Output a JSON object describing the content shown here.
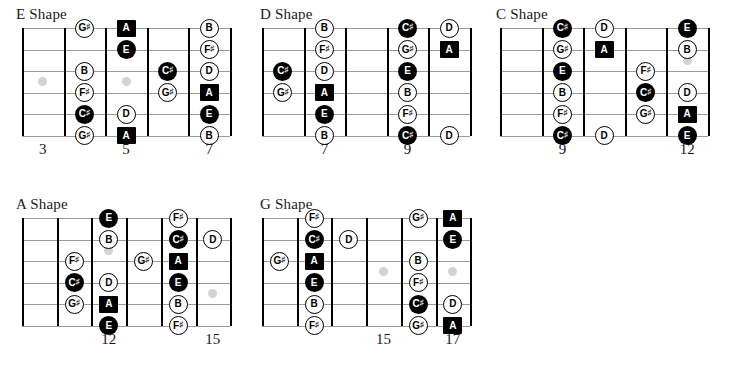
{
  "page": {
    "marker_legend": {
      "open": "white circle note",
      "filled": "black circle note",
      "root": "black square root note"
    },
    "colors": {
      "string_line": "#9a9a9a",
      "fret_line": "#000000",
      "inlay_dot": "#d3d3d3",
      "note_fill": "#000000",
      "text": "#1a1a1a"
    }
  },
  "diagrams": [
    {
      "id": "e-shape",
      "title": "E Shape",
      "strings": 6,
      "frets": 5,
      "fret_numbers": [
        {
          "label": "3",
          "fret": 1
        },
        {
          "label": "5",
          "fret": 3
        },
        {
          "label": "7",
          "fret": 5
        }
      ],
      "inlays": [
        {
          "fret": 1,
          "string_gap": 3
        },
        {
          "fret": 3,
          "string_gap": 3
        }
      ],
      "notes": [
        {
          "name": "G",
          "acc": "♯",
          "string": 1,
          "fret": 2,
          "style": "open"
        },
        {
          "name": "B",
          "acc": "",
          "string": 3,
          "fret": 2,
          "style": "open"
        },
        {
          "name": "F",
          "acc": "♯",
          "string": 4,
          "fret": 2,
          "style": "open"
        },
        {
          "name": "C",
          "acc": "♯",
          "string": 5,
          "fret": 2,
          "style": "filled"
        },
        {
          "name": "G",
          "acc": "♯",
          "string": 6,
          "fret": 2,
          "style": "open"
        },
        {
          "name": "A",
          "acc": "",
          "string": 1,
          "fret": 3,
          "style": "root"
        },
        {
          "name": "E",
          "acc": "",
          "string": 2,
          "fret": 3,
          "style": "filled"
        },
        {
          "name": "D",
          "acc": "",
          "string": 5,
          "fret": 3,
          "style": "open"
        },
        {
          "name": "A",
          "acc": "",
          "string": 6,
          "fret": 3,
          "style": "root"
        },
        {
          "name": "C",
          "acc": "♯",
          "string": 3,
          "fret": 4,
          "style": "filled"
        },
        {
          "name": "G",
          "acc": "♯",
          "string": 4,
          "fret": 4,
          "style": "open"
        },
        {
          "name": "B",
          "acc": "",
          "string": 1,
          "fret": 5,
          "style": "open"
        },
        {
          "name": "F",
          "acc": "♯",
          "string": 2,
          "fret": 5,
          "style": "open"
        },
        {
          "name": "D",
          "acc": "",
          "string": 3,
          "fret": 5,
          "style": "open"
        },
        {
          "name": "A",
          "acc": "",
          "string": 4,
          "fret": 5,
          "style": "root"
        },
        {
          "name": "E",
          "acc": "",
          "string": 5,
          "fret": 5,
          "style": "filled"
        },
        {
          "name": "B",
          "acc": "",
          "string": 6,
          "fret": 5,
          "style": "open"
        }
      ]
    },
    {
      "id": "d-shape",
      "title": "D Shape",
      "strings": 6,
      "frets": 5,
      "fret_numbers": [
        {
          "label": "7",
          "fret": 2
        },
        {
          "label": "9",
          "fret": 4
        }
      ],
      "inlays": [],
      "notes": [
        {
          "name": "C",
          "acc": "♯",
          "string": 3,
          "fret": 1,
          "style": "filled"
        },
        {
          "name": "G",
          "acc": "♯",
          "string": 4,
          "fret": 1,
          "style": "open"
        },
        {
          "name": "B",
          "acc": "",
          "string": 1,
          "fret": 2,
          "style": "open"
        },
        {
          "name": "F",
          "acc": "♯",
          "string": 2,
          "fret": 2,
          "style": "open"
        },
        {
          "name": "D",
          "acc": "",
          "string": 3,
          "fret": 2,
          "style": "open"
        },
        {
          "name": "A",
          "acc": "",
          "string": 4,
          "fret": 2,
          "style": "root"
        },
        {
          "name": "E",
          "acc": "",
          "string": 5,
          "fret": 2,
          "style": "filled"
        },
        {
          "name": "B",
          "acc": "",
          "string": 6,
          "fret": 2,
          "style": "open"
        },
        {
          "name": "C",
          "acc": "♯",
          "string": 1,
          "fret": 4,
          "style": "filled"
        },
        {
          "name": "G",
          "acc": "♯",
          "string": 2,
          "fret": 4,
          "style": "open"
        },
        {
          "name": "E",
          "acc": "",
          "string": 3,
          "fret": 4,
          "style": "filled"
        },
        {
          "name": "B",
          "acc": "",
          "string": 4,
          "fret": 4,
          "style": "open"
        },
        {
          "name": "F",
          "acc": "♯",
          "string": 5,
          "fret": 4,
          "style": "open"
        },
        {
          "name": "C",
          "acc": "♯",
          "string": 6,
          "fret": 4,
          "style": "filled"
        },
        {
          "name": "D",
          "acc": "",
          "string": 1,
          "fret": 5,
          "style": "open"
        },
        {
          "name": "A",
          "acc": "",
          "string": 2,
          "fret": 5,
          "style": "root"
        },
        {
          "name": "D",
          "acc": "",
          "string": 6,
          "fret": 5,
          "style": "open"
        }
      ]
    },
    {
      "id": "c-shape",
      "title": "C Shape",
      "strings": 6,
      "frets": 5,
      "fret_numbers": [
        {
          "label": "9",
          "fret": 2
        },
        {
          "label": "12",
          "fret": 5
        }
      ],
      "inlays": [
        {
          "fret": 5,
          "string_gap": 2
        }
      ],
      "notes": [
        {
          "name": "C",
          "acc": "♯",
          "string": 1,
          "fret": 2,
          "style": "filled"
        },
        {
          "name": "G",
          "acc": "♯",
          "string": 2,
          "fret": 2,
          "style": "open"
        },
        {
          "name": "E",
          "acc": "",
          "string": 3,
          "fret": 2,
          "style": "filled"
        },
        {
          "name": "B",
          "acc": "",
          "string": 4,
          "fret": 2,
          "style": "open"
        },
        {
          "name": "F",
          "acc": "♯",
          "string": 5,
          "fret": 2,
          "style": "open"
        },
        {
          "name": "C",
          "acc": "♯",
          "string": 6,
          "fret": 2,
          "style": "filled"
        },
        {
          "name": "D",
          "acc": "",
          "string": 1,
          "fret": 3,
          "style": "open"
        },
        {
          "name": "A",
          "acc": "",
          "string": 2,
          "fret": 3,
          "style": "root"
        },
        {
          "name": "D",
          "acc": "",
          "string": 6,
          "fret": 3,
          "style": "open"
        },
        {
          "name": "F",
          "acc": "♯",
          "string": 3,
          "fret": 4,
          "style": "open"
        },
        {
          "name": "C",
          "acc": "♯",
          "string": 4,
          "fret": 4,
          "style": "filled"
        },
        {
          "name": "G",
          "acc": "♯",
          "string": 5,
          "fret": 4,
          "style": "open"
        },
        {
          "name": "E",
          "acc": "",
          "string": 1,
          "fret": 5,
          "style": "filled"
        },
        {
          "name": "B",
          "acc": "",
          "string": 2,
          "fret": 5,
          "style": "open"
        },
        {
          "name": "D",
          "acc": "",
          "string": 4,
          "fret": 5,
          "style": "open"
        },
        {
          "name": "A",
          "acc": "",
          "string": 5,
          "fret": 5,
          "style": "root"
        },
        {
          "name": "E",
          "acc": "",
          "string": 6,
          "fret": 5,
          "style": "filled"
        }
      ]
    },
    {
      "id": "a-shape",
      "title": "A Shape",
      "strings": 6,
      "frets": 6,
      "fret_numbers": [
        {
          "label": "12",
          "fret": 3
        },
        {
          "label": "15",
          "fret": 6
        }
      ],
      "inlays": [
        {
          "fret": 3,
          "string_gap": 2
        },
        {
          "fret": 6,
          "string_gap": 4
        }
      ],
      "notes": [
        {
          "name": "F",
          "acc": "♯",
          "string": 3,
          "fret": 2,
          "style": "open"
        },
        {
          "name": "C",
          "acc": "♯",
          "string": 4,
          "fret": 2,
          "style": "filled"
        },
        {
          "name": "G",
          "acc": "♯",
          "string": 5,
          "fret": 2,
          "style": "open"
        },
        {
          "name": "E",
          "acc": "",
          "string": 1,
          "fret": 3,
          "style": "filled"
        },
        {
          "name": "B",
          "acc": "",
          "string": 2,
          "fret": 3,
          "style": "open"
        },
        {
          "name": "D",
          "acc": "",
          "string": 4,
          "fret": 3,
          "style": "open"
        },
        {
          "name": "A",
          "acc": "",
          "string": 5,
          "fret": 3,
          "style": "root"
        },
        {
          "name": "E",
          "acc": "",
          "string": 6,
          "fret": 3,
          "style": "filled"
        },
        {
          "name": "G",
          "acc": "♯",
          "string": 3,
          "fret": 4,
          "style": "open"
        },
        {
          "name": "F",
          "acc": "♯",
          "string": 1,
          "fret": 5,
          "style": "open"
        },
        {
          "name": "C",
          "acc": "♯",
          "string": 2,
          "fret": 5,
          "style": "filled"
        },
        {
          "name": "A",
          "acc": "",
          "string": 3,
          "fret": 5,
          "style": "root"
        },
        {
          "name": "E",
          "acc": "",
          "string": 4,
          "fret": 5,
          "style": "filled"
        },
        {
          "name": "B",
          "acc": "",
          "string": 5,
          "fret": 5,
          "style": "open"
        },
        {
          "name": "F",
          "acc": "♯",
          "string": 6,
          "fret": 5,
          "style": "open"
        },
        {
          "name": "D",
          "acc": "",
          "string": 2,
          "fret": 6,
          "style": "open"
        }
      ]
    },
    {
      "id": "g-shape",
      "title": "G Shape",
      "strings": 6,
      "frets": 6,
      "fret_numbers": [
        {
          "label": "15",
          "fret": 4
        },
        {
          "label": "17",
          "fret": 6
        }
      ],
      "inlays": [
        {
          "fret": 4,
          "string_gap": 3
        },
        {
          "fret": 6,
          "string_gap": 3
        }
      ],
      "notes": [
        {
          "name": "G",
          "acc": "♯",
          "string": 3,
          "fret": 1,
          "style": "open"
        },
        {
          "name": "F",
          "acc": "♯",
          "string": 1,
          "fret": 2,
          "style": "open"
        },
        {
          "name": "C",
          "acc": "♯",
          "string": 2,
          "fret": 2,
          "style": "filled"
        },
        {
          "name": "A",
          "acc": "",
          "string": 3,
          "fret": 2,
          "style": "root"
        },
        {
          "name": "E",
          "acc": "",
          "string": 4,
          "fret": 2,
          "style": "filled"
        },
        {
          "name": "B",
          "acc": "",
          "string": 5,
          "fret": 2,
          "style": "open"
        },
        {
          "name": "F",
          "acc": "♯",
          "string": 6,
          "fret": 2,
          "style": "open"
        },
        {
          "name": "D",
          "acc": "",
          "string": 2,
          "fret": 3,
          "style": "open"
        },
        {
          "name": "G",
          "acc": "♯",
          "string": 1,
          "fret": 5,
          "style": "open"
        },
        {
          "name": "B",
          "acc": "",
          "string": 3,
          "fret": 5,
          "style": "open"
        },
        {
          "name": "F",
          "acc": "♯",
          "string": 4,
          "fret": 5,
          "style": "open"
        },
        {
          "name": "C",
          "acc": "♯",
          "string": 5,
          "fret": 5,
          "style": "filled"
        },
        {
          "name": "G",
          "acc": "♯",
          "string": 6,
          "fret": 5,
          "style": "open"
        },
        {
          "name": "A",
          "acc": "",
          "string": 1,
          "fret": 6,
          "style": "root"
        },
        {
          "name": "E",
          "acc": "",
          "string": 2,
          "fret": 6,
          "style": "filled"
        },
        {
          "name": "D",
          "acc": "",
          "string": 5,
          "fret": 6,
          "style": "open"
        },
        {
          "name": "A",
          "acc": "",
          "string": 6,
          "fret": 6,
          "style": "root"
        }
      ]
    }
  ]
}
